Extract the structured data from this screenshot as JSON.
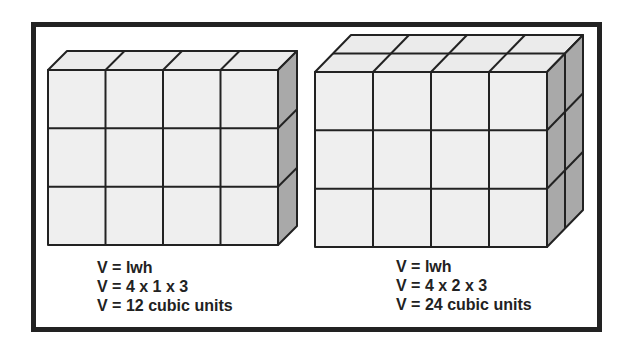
{
  "figures": [
    {
      "id": "left",
      "description": "Rectangular prism of unit cubes, 4 long x 1 wide x 3 high",
      "dimensions": {
        "length": 4,
        "width": 1,
        "height": 3
      },
      "caption": [
        "V = lwh",
        "V = 4 x 1 x 3",
        "V = 12 cubic units"
      ]
    },
    {
      "id": "right",
      "description": "Rectangular prism of unit cubes, 4 long x 2 wide x 3 high",
      "dimensions": {
        "length": 4,
        "width": 2,
        "height": 3
      },
      "caption": [
        "V = lwh",
        "V = 4 x 2 x 3",
        "V = 24 cubic units"
      ]
    }
  ],
  "colors": {
    "front_face": "#efefef",
    "top_face": "#eaeaea",
    "side_face": "#a9a9a9",
    "line": "#222222",
    "frame": "#222222"
  }
}
